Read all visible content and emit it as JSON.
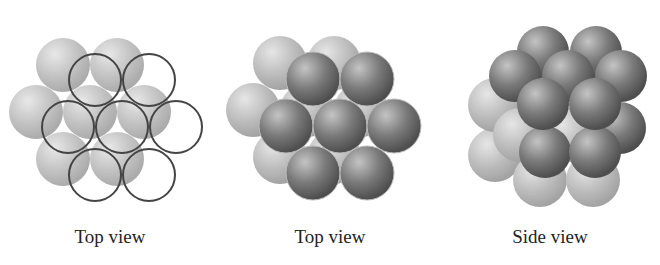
{
  "figure": {
    "panels": [
      {
        "caption": "Top view",
        "description": "Hexagonal close-packed first layer (7 spheres) with second layer outlined as open circles over triangular holes"
      },
      {
        "caption": "Top view",
        "description": "Second layer of darker spheres sitting in holes of first layer"
      },
      {
        "caption": "Side view",
        "description": "Stacked layers of spheres viewed from side"
      }
    ]
  },
  "colors": {
    "light_sphere": "#b8b8b8",
    "dark_sphere": "#6e6e6e",
    "outline": "#444444",
    "caption": "#222222"
  }
}
